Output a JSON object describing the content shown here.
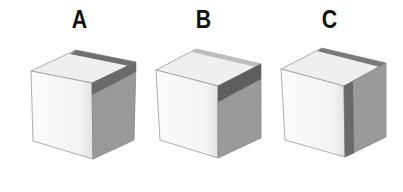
{
  "figure": {
    "cubes": [
      {
        "id": "A",
        "label": "A",
        "shading": "dark band along back edge of top face and top of right face"
      },
      {
        "id": "B",
        "label": "B",
        "shading": "dark band across upper part of right face"
      },
      {
        "id": "C",
        "label": "C",
        "shading": "dark vertical strip on right face near front edge, dark strip at back of top face"
      }
    ]
  },
  "colors": {
    "front_face": "#f7f7f7",
    "top_face": "#eeeeee",
    "right_face": "#9c9c9c",
    "dark_band": "#6a6a6a",
    "edge": "#888888"
  }
}
